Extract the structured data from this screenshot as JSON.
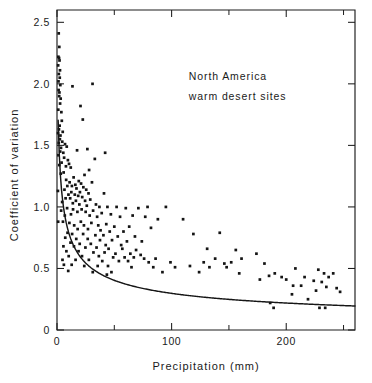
{
  "chart_data": {
    "type": "scatter",
    "title": "",
    "xlabel": "Precipitation (mm)",
    "ylabel": "Coefficient of variation",
    "xlim": [
      0,
      260
    ],
    "ylim": [
      0,
      2.6
    ],
    "grid": false,
    "legend_position": "none",
    "annotations": [
      {
        "text": "North America",
        "x": 115,
        "y": 2.03
      },
      {
        "text": "warm desert sites",
        "x": 115,
        "y": 1.87
      }
    ],
    "x_ticks": [
      {
        "value": 0,
        "label": "0",
        "major": true
      },
      {
        "value": 50,
        "label": "",
        "major": false
      },
      {
        "value": 100,
        "label": "100",
        "major": true
      },
      {
        "value": 150,
        "label": "",
        "major": false
      },
      {
        "value": 200,
        "label": "200",
        "major": true
      },
      {
        "value": 250,
        "label": "",
        "major": false
      }
    ],
    "y_ticks": [
      {
        "value": 0,
        "label": "0",
        "major": true
      },
      {
        "value": 0.5,
        "label": "0.5",
        "major": true
      },
      {
        "value": 1.0,
        "label": "1.0",
        "major": true
      },
      {
        "value": 1.5,
        "label": "1.5",
        "major": true
      },
      {
        "value": 2.0,
        "label": "2.0",
        "major": true
      },
      {
        "value": 2.5,
        "label": "2.5",
        "major": true
      }
    ],
    "fit_curve": {
      "description": "decreasing power-law fit of coefficient of variation versus precipitation",
      "form": "y = a * (x + c)^(-b)",
      "a": 2.32,
      "b": 0.445,
      "c": 1.0,
      "x_start": 1,
      "x_end": 260,
      "points": [
        [
          1,
          2.32
        ],
        [
          2,
          1.92
        ],
        [
          3,
          1.73
        ],
        [
          4,
          1.6
        ],
        [
          5,
          1.51
        ],
        [
          7,
          1.37
        ],
        [
          9,
          1.27
        ],
        [
          12,
          1.16
        ],
        [
          15,
          1.08
        ],
        [
          20,
          0.97
        ],
        [
          25,
          0.9
        ],
        [
          30,
          0.84
        ],
        [
          40,
          0.75
        ],
        [
          50,
          0.69
        ],
        [
          60,
          0.64
        ],
        [
          70,
          0.6
        ],
        [
          80,
          0.57
        ],
        [
          90,
          0.54
        ],
        [
          100,
          0.52
        ],
        [
          120,
          0.48
        ],
        [
          140,
          0.45
        ],
        [
          160,
          0.42
        ],
        [
          180,
          0.4
        ],
        [
          200,
          0.38
        ],
        [
          220,
          0.36
        ],
        [
          240,
          0.35
        ],
        [
          260,
          0.34
        ]
      ]
    },
    "points": [
      [
        1.5,
        2.41
      ],
      [
        2.0,
        2.3
      ],
      [
        1.2,
        2.22
      ],
      [
        1.8,
        2.21
      ],
      [
        2.2,
        2.19
      ],
      [
        1.0,
        2.15
      ],
      [
        2.6,
        2.11
      ],
      [
        1.6,
        2.08
      ],
      [
        2.4,
        2.05
      ],
      [
        1.3,
        2.02
      ],
      [
        2.9,
        1.99
      ],
      [
        13.5,
        1.98
      ],
      [
        31.0,
        2.0
      ],
      [
        1.4,
        1.95
      ],
      [
        2.1,
        1.93
      ],
      [
        1.9,
        1.9
      ],
      [
        3.2,
        1.88
      ],
      [
        2.7,
        1.84
      ],
      [
        20.5,
        1.82
      ],
      [
        1.1,
        1.79
      ],
      [
        3.8,
        1.77
      ],
      [
        22.5,
        1.71
      ],
      [
        4.2,
        1.7
      ],
      [
        2.3,
        1.66
      ],
      [
        1.7,
        1.63
      ],
      [
        5.0,
        1.61
      ],
      [
        0.9,
        1.6
      ],
      [
        3.0,
        1.58
      ],
      [
        2.5,
        1.55
      ],
      [
        4.6,
        1.53
      ],
      [
        1.5,
        1.52
      ],
      [
        7.0,
        1.51
      ],
      [
        8.5,
        1.49
      ],
      [
        3.5,
        1.48
      ],
      [
        17.5,
        1.46
      ],
      [
        2.8,
        1.45
      ],
      [
        5.5,
        1.44
      ],
      [
        42.0,
        1.44
      ],
      [
        26.5,
        1.47
      ],
      [
        1.2,
        1.42
      ],
      [
        6.2,
        1.4
      ],
      [
        33.0,
        1.39
      ],
      [
        9.5,
        1.38
      ],
      [
        4.0,
        1.36
      ],
      [
        10.5,
        1.35
      ],
      [
        2.0,
        1.34
      ],
      [
        7.8,
        1.33
      ],
      [
        12.0,
        1.32
      ],
      [
        28.0,
        1.3
      ],
      [
        5.8,
        1.28
      ],
      [
        3.3,
        1.27
      ],
      [
        24.0,
        1.26
      ],
      [
        14.5,
        1.24
      ],
      [
        8.0,
        1.22
      ],
      [
        19.0,
        1.21
      ],
      [
        11.0,
        1.2
      ],
      [
        30.5,
        1.2
      ],
      [
        21.0,
        1.19
      ],
      [
        16.0,
        1.18
      ],
      [
        13.0,
        1.17
      ],
      [
        9.0,
        1.17
      ],
      [
        23.0,
        1.16
      ],
      [
        17.0,
        1.15
      ],
      [
        6.5,
        1.14
      ],
      [
        25.5,
        1.14
      ],
      [
        0.8,
        1.13
      ],
      [
        12.5,
        1.12
      ],
      [
        20.0,
        1.12
      ],
      [
        27.5,
        1.11
      ],
      [
        15.5,
        1.1
      ],
      [
        10.0,
        1.1
      ],
      [
        18.5,
        1.09
      ],
      [
        41.0,
        1.11
      ],
      [
        22.0,
        1.08
      ],
      [
        7.5,
        1.07
      ],
      [
        11.5,
        1.07
      ],
      [
        29.0,
        1.06
      ],
      [
        16.5,
        1.05
      ],
      [
        24.5,
        1.05
      ],
      [
        4.5,
        1.04
      ],
      [
        13.8,
        1.03
      ],
      [
        19.5,
        1.02
      ],
      [
        34.0,
        1.02
      ],
      [
        26.0,
        1.01
      ],
      [
        37.0,
        1.0
      ],
      [
        44.0,
        1.0
      ],
      [
        52.0,
        1.0
      ],
      [
        60.0,
        0.99
      ],
      [
        71.0,
        0.99
      ],
      [
        79.0,
        1.0
      ],
      [
        95.0,
        1.0
      ],
      [
        8.8,
        0.99
      ],
      [
        14.0,
        0.98
      ],
      [
        21.5,
        0.98
      ],
      [
        31.5,
        0.97
      ],
      [
        3.6,
        0.97
      ],
      [
        17.8,
        0.96
      ],
      [
        25.0,
        0.96
      ],
      [
        39.0,
        0.95
      ],
      [
        47.0,
        0.94
      ],
      [
        12.2,
        0.94
      ],
      [
        6.8,
        0.93
      ],
      [
        28.5,
        0.93
      ],
      [
        35.0,
        0.92
      ],
      [
        55.0,
        0.92
      ],
      [
        66.0,
        0.93
      ],
      [
        77.0,
        0.92
      ],
      [
        88.0,
        0.9
      ],
      [
        110.0,
        0.9
      ],
      [
        1.0,
        0.88
      ],
      [
        5.2,
        0.88
      ],
      [
        10.8,
        0.87
      ],
      [
        20.8,
        0.88
      ],
      [
        30.0,
        0.87
      ],
      [
        43.0,
        0.86
      ],
      [
        15.0,
        0.85
      ],
      [
        23.5,
        0.85
      ],
      [
        36.0,
        0.85
      ],
      [
        50.0,
        0.84
      ],
      [
        63.0,
        0.84
      ],
      [
        82.0,
        0.83
      ],
      [
        18.0,
        0.82
      ],
      [
        27.0,
        0.82
      ],
      [
        38.0,
        0.81
      ],
      [
        46.0,
        0.8
      ],
      [
        58.0,
        0.8
      ],
      [
        9.2,
        0.79
      ],
      [
        13.2,
        0.78
      ],
      [
        22.8,
        0.78
      ],
      [
        33.5,
        0.77
      ],
      [
        40.5,
        0.77
      ],
      [
        53.0,
        0.76
      ],
      [
        68.0,
        0.76
      ],
      [
        119.0,
        0.78
      ],
      [
        142.0,
        0.79
      ],
      [
        7.2,
        0.75
      ],
      [
        16.8,
        0.74
      ],
      [
        26.8,
        0.74
      ],
      [
        37.5,
        0.73
      ],
      [
        48.0,
        0.73
      ],
      [
        61.0,
        0.72
      ],
      [
        74.0,
        0.72
      ],
      [
        11.8,
        0.71
      ],
      [
        19.8,
        0.7
      ],
      [
        29.5,
        0.7
      ],
      [
        42.5,
        0.69
      ],
      [
        56.0,
        0.69
      ],
      [
        5.6,
        0.68
      ],
      [
        14.8,
        0.68
      ],
      [
        24.8,
        0.67
      ],
      [
        34.5,
        0.67
      ],
      [
        45.0,
        0.66
      ],
      [
        57.0,
        0.66
      ],
      [
        69.0,
        0.65
      ],
      [
        131.0,
        0.66
      ],
      [
        156.0,
        0.65
      ],
      [
        8.2,
        0.64
      ],
      [
        18.8,
        0.64
      ],
      [
        31.8,
        0.63
      ],
      [
        41.5,
        0.63
      ],
      [
        51.0,
        0.62
      ],
      [
        64.0,
        0.62
      ],
      [
        73.0,
        0.61
      ],
      [
        174.0,
        0.62
      ],
      [
        10.2,
        0.6
      ],
      [
        21.8,
        0.6
      ],
      [
        36.5,
        0.6
      ],
      [
        49.0,
        0.59
      ],
      [
        59.0,
        0.59
      ],
      [
        67.0,
        0.59
      ],
      [
        76.0,
        0.58
      ],
      [
        86.0,
        0.58
      ],
      [
        138.0,
        0.58
      ],
      [
        161.0,
        0.58
      ],
      [
        4.8,
        0.57
      ],
      [
        16.2,
        0.57
      ],
      [
        27.8,
        0.57
      ],
      [
        39.5,
        0.56
      ],
      [
        54.0,
        0.56
      ],
      [
        62.0,
        0.56
      ],
      [
        80.0,
        0.55
      ],
      [
        99.0,
        0.55
      ],
      [
        128.0,
        0.55
      ],
      [
        146.0,
        0.54
      ],
      [
        152.0,
        0.55
      ],
      [
        181.0,
        0.54
      ],
      [
        6.0,
        0.53
      ],
      [
        12.8,
        0.53
      ],
      [
        23.8,
        0.52
      ],
      [
        35.5,
        0.52
      ],
      [
        44.5,
        0.52
      ],
      [
        65.0,
        0.51
      ],
      [
        84.0,
        0.51
      ],
      [
        103.0,
        0.51
      ],
      [
        116.0,
        0.52
      ],
      [
        133.0,
        0.51
      ],
      [
        148.0,
        0.51
      ],
      [
        208.0,
        0.5
      ],
      [
        228.0,
        0.49
      ],
      [
        9.8,
        0.48
      ],
      [
        31.2,
        0.47
      ],
      [
        47.5,
        0.47
      ],
      [
        92.0,
        0.47
      ],
      [
        124.0,
        0.47
      ],
      [
        159.0,
        0.46
      ],
      [
        190.0,
        0.46
      ],
      [
        233.0,
        0.46
      ],
      [
        241.0,
        0.46
      ],
      [
        43.5,
        0.45
      ],
      [
        185.0,
        0.44
      ],
      [
        196.0,
        0.43
      ],
      [
        216.0,
        0.43
      ],
      [
        237.0,
        0.43
      ],
      [
        177.0,
        0.41
      ],
      [
        200.0,
        0.41
      ],
      [
        224.0,
        0.4
      ],
      [
        231.0,
        0.39
      ],
      [
        206.0,
        0.36
      ],
      [
        213.0,
        0.36
      ],
      [
        235.0,
        0.35
      ],
      [
        244.0,
        0.34
      ],
      [
        226.0,
        0.32
      ],
      [
        247.0,
        0.31
      ],
      [
        205.0,
        0.29
      ],
      [
        219.0,
        0.25
      ],
      [
        186.0,
        0.22
      ],
      [
        189.0,
        0.18
      ],
      [
        229.0,
        0.18
      ],
      [
        234.0,
        0.18
      ]
    ]
  },
  "axis_geometry": {
    "plot_left_px": 57,
    "plot_right_px": 355,
    "plot_top_px": 10,
    "plot_bottom_px": 330
  }
}
